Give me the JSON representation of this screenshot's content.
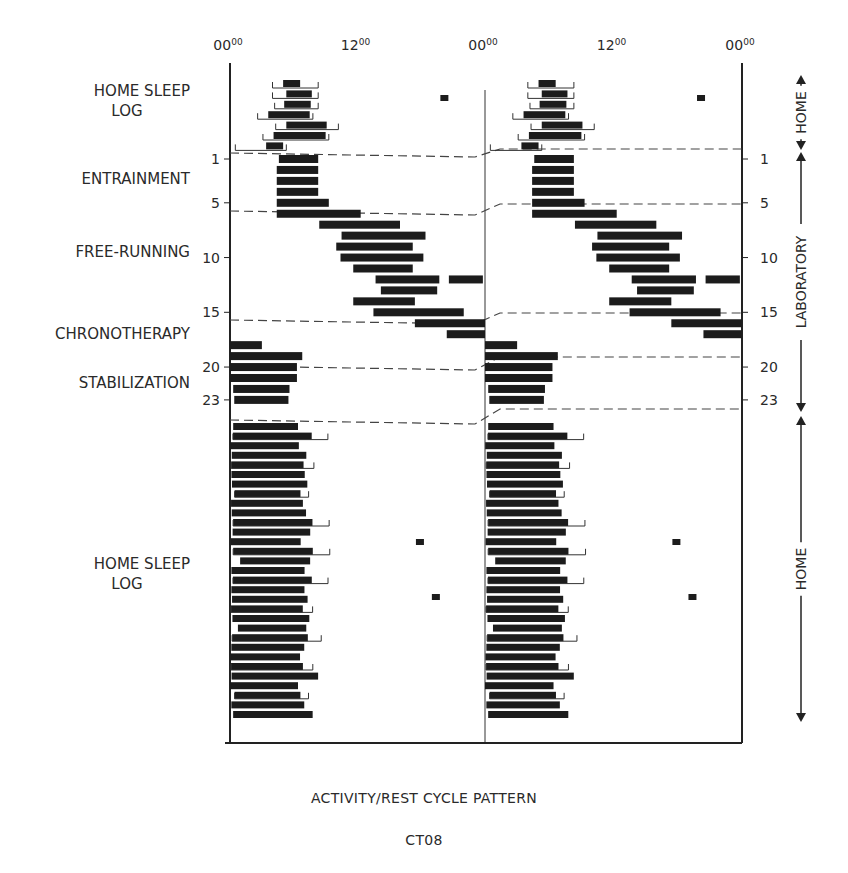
{
  "chart_data": {
    "type": "actogram",
    "title": "ACTIVITY/REST CYCLE PATTERN",
    "subtitle": "CT08",
    "plot": "double-plotted 48h raster; black bars = sleep, brackets = time in bed",
    "x_ticks": [
      {
        "label": "00",
        "sup": "00",
        "hour": 0
      },
      {
        "label": "12",
        "sup": "00",
        "hour": 12
      },
      {
        "label": "00",
        "sup": "00",
        "hour": 24
      },
      {
        "label": "12",
        "sup": "00",
        "hour": 36
      },
      {
        "label": "00",
        "sup": "00",
        "hour": 48
      }
    ],
    "xlim_hours": [
      0,
      48
    ],
    "y_day_ticks": [
      1,
      5,
      10,
      15,
      20,
      23
    ],
    "phase_labels": [
      {
        "text": [
          "HOME SLEEP",
          "LOG"
        ],
        "y": 105
      },
      {
        "text": [
          "ENTRAINMENT"
        ],
        "y": 184
      },
      {
        "text": [
          "FREE-RUNNING"
        ],
        "y": 257
      },
      {
        "text": [
          "CHRONOTHERAPY"
        ],
        "y": 339
      },
      {
        "text": [
          "STABILIZATION"
        ],
        "y": 388
      },
      {
        "text": [
          "HOME SLEEP",
          "LOG"
        ],
        "y": 578
      }
    ],
    "side_brackets": [
      {
        "label": "HOME",
        "y_top": 75,
        "y_bottom": 150
      },
      {
        "label": "LABORATORY",
        "y_top": 152,
        "y_bottom": 412
      },
      {
        "label": "HOME",
        "y_top": 416,
        "y_bottom": 722
      }
    ],
    "pre_lab_home_rows": [
      {
        "sleep": [
          5.0,
          6.6
        ],
        "bed": [
          4.0,
          8.3
        ]
      },
      {
        "sleep": [
          5.3,
          7.7
        ],
        "bed": [
          4.0,
          8.3
        ]
      },
      {
        "sleep": [
          5.1,
          7.6
        ],
        "bed": [
          4.2,
          8.3
        ]
      },
      {
        "sleep": [
          3.6,
          7.5
        ],
        "bed": [
          2.6,
          7.8
        ]
      },
      {
        "sleep": [
          5.3,
          9.1
        ],
        "bed": [
          4.3,
          10.2
        ]
      },
      {
        "sleep": [
          4.1,
          9.0
        ],
        "bed": [
          3.1,
          9.3
        ]
      },
      {
        "sleep": [
          3.4,
          5.0
        ],
        "bed": [
          0.5,
          5.3
        ]
      }
    ],
    "lab_rows": [
      {
        "day": 1,
        "sleep": [
          4.6,
          8.3
        ]
      },
      {
        "day": 2,
        "sleep": [
          4.4,
          8.3
        ]
      },
      {
        "day": 3,
        "sleep": [
          4.4,
          8.3
        ]
      },
      {
        "day": 4,
        "sleep": [
          4.4,
          8.3
        ]
      },
      {
        "day": 5,
        "sleep": [
          4.4,
          9.3
        ]
      },
      {
        "day": 6,
        "sleep": [
          4.4,
          12.3
        ]
      },
      {
        "day": 7,
        "sleep": [
          8.4,
          16.0
        ]
      },
      {
        "day": 8,
        "sleep": [
          10.5,
          18.4
        ]
      },
      {
        "day": 9,
        "sleep": [
          10.0,
          17.2
        ]
      },
      {
        "day": 10,
        "sleep": [
          10.4,
          18.2
        ]
      },
      {
        "day": 11,
        "sleep": [
          11.6,
          17.2
        ]
      },
      {
        "day": 12,
        "sleep": [
          13.7,
          19.7
        ],
        "extra": [
          20.6,
          23.8
        ]
      },
      {
        "day": 13,
        "sleep": [
          14.2,
          19.5
        ]
      },
      {
        "day": 14,
        "sleep": [
          11.6,
          17.4
        ]
      },
      {
        "day": 15,
        "sleep": [
          13.5,
          22.0
        ]
      },
      {
        "day": 16,
        "sleep": [
          17.4,
          24.0
        ]
      },
      {
        "day": 17,
        "sleep": [
          20.4,
          24.0
        ]
      },
      {
        "day": 18,
        "sleep": [
          0.0,
          3.0
        ]
      },
      {
        "day": 19,
        "sleep": [
          0.0,
          6.8
        ]
      },
      {
        "day": 20,
        "sleep": [
          0.0,
          6.3
        ]
      },
      {
        "day": 21,
        "sleep": [
          0.0,
          6.3
        ]
      },
      {
        "day": 22,
        "sleep": [
          0.3,
          5.6
        ]
      },
      {
        "day": 23,
        "sleep": [
          0.4,
          5.5
        ]
      }
    ],
    "post_lab_home_rows_count": 31,
    "naps": [
      {
        "panel": "left",
        "hour": 19.8,
        "y": 95
      },
      {
        "panel": "left",
        "hour": 17.5,
        "y": 539
      },
      {
        "panel": "left",
        "hour": 19.0,
        "y": 594
      }
    ]
  },
  "caption": {
    "title": "ACTIVITY/REST CYCLE PATTERN",
    "subject": "CT08"
  }
}
